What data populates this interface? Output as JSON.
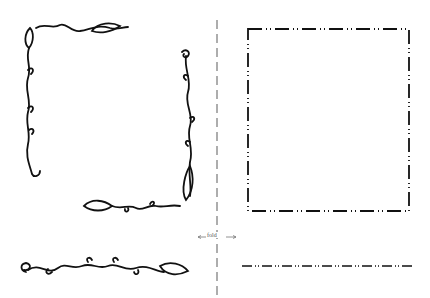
{
  "page": {
    "fold_label": "fold",
    "colors": {
      "ink": "#111111",
      "fold_line": "#777777",
      "background": "#ffffff"
    },
    "elements": [
      {
        "name": "vine-corner-top-left",
        "type": "vine-border"
      },
      {
        "name": "vine-corner-bottom-right",
        "type": "vine-border"
      },
      {
        "name": "vine-strip-bottom",
        "type": "vine-border"
      },
      {
        "name": "dotted-dash-frame",
        "type": "dashed-border"
      },
      {
        "name": "dotted-dash-strip",
        "type": "dashed-border"
      },
      {
        "name": "fold-line",
        "type": "guide"
      }
    ]
  }
}
